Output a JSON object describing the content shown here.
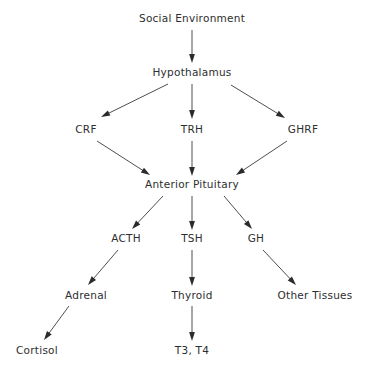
{
  "diagram": {
    "type": "flowchart",
    "background_color": "#ffffff",
    "text_color": "#2e2e2e",
    "edge_color": "#3a3a3a",
    "nodes": [
      {
        "id": "social_environment",
        "label": "Social Environment",
        "x": 192,
        "y": 22,
        "level": 0
      },
      {
        "id": "hypothalamus",
        "label": "Hypothalamus",
        "x": 192,
        "y": 76,
        "level": 1
      },
      {
        "id": "crf",
        "label": "CRF",
        "x": 86,
        "y": 133,
        "level": 2
      },
      {
        "id": "trh",
        "label": "TRH",
        "x": 192,
        "y": 133,
        "level": 2
      },
      {
        "id": "ghrf",
        "label": "GHRF",
        "x": 303,
        "y": 133,
        "level": 2
      },
      {
        "id": "anterior_pituitary",
        "label": "Anterior Pituitary",
        "x": 192,
        "y": 188,
        "level": 3
      },
      {
        "id": "acth",
        "label": "ACTH",
        "x": 126,
        "y": 242,
        "level": 4
      },
      {
        "id": "tsh",
        "label": "TSH",
        "x": 192,
        "y": 242,
        "level": 4
      },
      {
        "id": "gh",
        "label": "GH",
        "x": 256,
        "y": 242,
        "level": 4
      },
      {
        "id": "adrenal",
        "label": "Adrenal",
        "x": 86,
        "y": 299,
        "level": 5
      },
      {
        "id": "thyroid",
        "label": "Thyroid",
        "x": 192,
        "y": 299,
        "level": 5
      },
      {
        "id": "other_tissues",
        "label": "Other Tissues",
        "x": 315,
        "y": 299,
        "level": 5
      },
      {
        "id": "cortisol",
        "label": "Cortisol",
        "x": 37,
        "y": 354,
        "level": 6
      },
      {
        "id": "t3_t4",
        "label": "T3, T4",
        "x": 192,
        "y": 354,
        "level": 6
      }
    ],
    "edges": [
      {
        "id": "e-social-hypothalamus",
        "from": "social_environment",
        "to": "hypothalamus",
        "x1": 192,
        "y1": 30,
        "x2": 192,
        "y2": 63
      },
      {
        "id": "e-hypothalamus-crf",
        "from": "hypothalamus",
        "to": "crf",
        "x1": 168,
        "y1": 84,
        "x2": 101,
        "y2": 117
      },
      {
        "id": "e-hypothalamus-trh",
        "from": "hypothalamus",
        "to": "trh",
        "x1": 192,
        "y1": 84,
        "x2": 192,
        "y2": 119
      },
      {
        "id": "e-hypothalamus-ghrf",
        "from": "hypothalamus",
        "to": "ghrf",
        "x1": 231,
        "y1": 85,
        "x2": 285,
        "y2": 118
      },
      {
        "id": "e-crf-pituitary",
        "from": "crf",
        "to": "anterior_pituitary",
        "x1": 97,
        "y1": 141,
        "x2": 150,
        "y2": 175
      },
      {
        "id": "e-trh-pituitary",
        "from": "trh",
        "to": "anterior_pituitary",
        "x1": 192,
        "y1": 141,
        "x2": 192,
        "y2": 176
      },
      {
        "id": "e-ghrf-pituitary",
        "from": "ghrf",
        "to": "anterior_pituitary",
        "x1": 287,
        "y1": 141,
        "x2": 236,
        "y2": 175
      },
      {
        "id": "e-pituitary-acth",
        "from": "anterior_pituitary",
        "to": "acth",
        "x1": 163,
        "y1": 196,
        "x2": 132,
        "y2": 229
      },
      {
        "id": "e-pituitary-tsh",
        "from": "anterior_pituitary",
        "to": "tsh",
        "x1": 192,
        "y1": 196,
        "x2": 192,
        "y2": 230
      },
      {
        "id": "e-pituitary-gh",
        "from": "anterior_pituitary",
        "to": "gh",
        "x1": 224,
        "y1": 196,
        "x2": 252,
        "y2": 229
      },
      {
        "id": "e-acth-adrenal",
        "from": "acth",
        "to": "adrenal",
        "x1": 118,
        "y1": 250,
        "x2": 88,
        "y2": 285
      },
      {
        "id": "e-tsh-thyroid",
        "from": "tsh",
        "to": "thyroid",
        "x1": 192,
        "y1": 250,
        "x2": 192,
        "y2": 286
      },
      {
        "id": "e-gh-other-tissues",
        "from": "gh",
        "to": "other_tissues",
        "x1": 263,
        "y1": 250,
        "x2": 296,
        "y2": 285
      },
      {
        "id": "e-adrenal-cortisol",
        "from": "adrenal",
        "to": "cortisol",
        "x1": 69,
        "y1": 306,
        "x2": 44,
        "y2": 340
      },
      {
        "id": "e-thyroid-t3t4",
        "from": "thyroid",
        "to": "t3_t4",
        "x1": 192,
        "y1": 306,
        "x2": 192,
        "y2": 341
      }
    ]
  }
}
